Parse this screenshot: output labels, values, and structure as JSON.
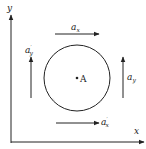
{
  "diagram": {
    "axes": {
      "x_label": "x",
      "y_label": "y"
    },
    "point": {
      "label": "A"
    },
    "vectors": {
      "ax": {
        "base": "a",
        "sub": "x",
        "prime": ""
      },
      "ax_prime": {
        "base": "a",
        "sub": "x",
        "prime": "′"
      },
      "ay": {
        "base": "a",
        "sub": "y",
        "prime": ""
      },
      "ay_prime": {
        "base": "a",
        "sub": "y",
        "prime": "′"
      }
    },
    "circulation": "clockwise",
    "colors": {
      "stroke": "#222222",
      "background": "#ffffff"
    }
  }
}
